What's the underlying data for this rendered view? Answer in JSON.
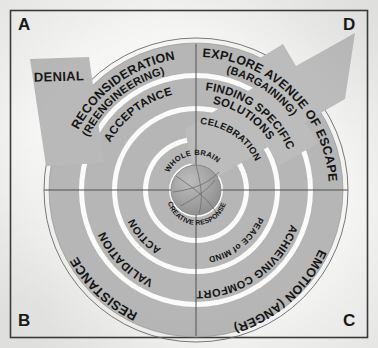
{
  "figure": {
    "corner_labels": {
      "a": "A",
      "b": "B",
      "c": "C",
      "d": "D"
    },
    "wedge": {
      "label": "DENIAL"
    },
    "arrow": {
      "name": "escape-arrow",
      "direction": "up-right"
    },
    "center": {
      "top_label": "WHOLE BRAIN",
      "bottom_label": "CREATIVE RESPONSE"
    },
    "quadrants": [
      {
        "id": "top-left",
        "corner": "A",
        "rings": [
          {
            "level": 1,
            "label": "RECONSIDERATION"
          },
          {
            "level": 1,
            "label": "(REENGINEERING)"
          },
          {
            "level": 2,
            "label": "ACCEPTANCE"
          }
        ]
      },
      {
        "id": "top-right",
        "corner": "D",
        "rings": [
          {
            "level": 1,
            "label": "EXPLORE AVENUE OF ESCAPE"
          },
          {
            "level": 1,
            "label": "(BARGAINING)"
          },
          {
            "level": 2,
            "label": "FINDING SPECIFIC"
          },
          {
            "level": 2,
            "label": "SOLUTIONS"
          },
          {
            "level": 3,
            "label": "CELEBRATION"
          }
        ]
      },
      {
        "id": "bottom-left",
        "corner": "B",
        "rings": [
          {
            "level": 1,
            "label": "RESISTANCE"
          },
          {
            "level": 2,
            "label": "VALIDATION"
          },
          {
            "level": 3,
            "label": "ACTION"
          }
        ]
      },
      {
        "id": "bottom-right",
        "corner": "C",
        "rings": [
          {
            "level": 1,
            "label": "EMOTION (ANGER)"
          },
          {
            "level": 2,
            "label": "ACHIEVING COMFORT"
          },
          {
            "level": 3,
            "label": "PEACE of MIND"
          }
        ]
      }
    ],
    "colors": {
      "ring_fill": "#b6b6b6",
      "ring_gap": "#fbfbfa",
      "outline": "#4a4a4a",
      "text": "#141414",
      "wedge_fill": "#b9b9b9",
      "arrow_fill": "#bcbcbc",
      "center_fill": "#a3a3a3",
      "frame": "#3d3d3d"
    }
  }
}
